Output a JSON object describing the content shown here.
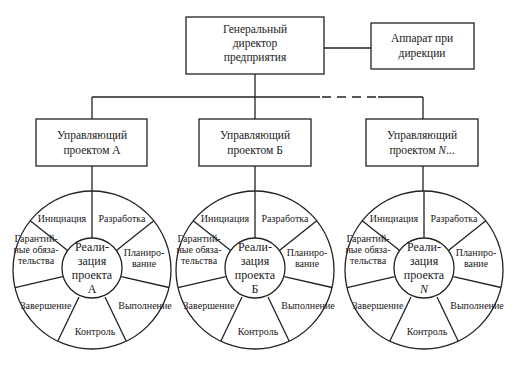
{
  "director": {
    "lines": [
      "Генеральный",
      "директор",
      "предприятия"
    ]
  },
  "apparatus": {
    "lines": [
      "Аппарат при",
      "дирекции"
    ]
  },
  "managers": [
    {
      "lines": [
        "Управляющий",
        "проектом А"
      ]
    },
    {
      "lines": [
        "Управляющий",
        "проектом Б"
      ]
    },
    {
      "lines": [
        "Управляющий",
        "проектом N..."
      ]
    }
  ],
  "wheels": [
    {
      "hub": [
        "Реали-",
        "зация",
        "проекта",
        "А"
      ],
      "segments": {
        "initiation": [
          "Инициация"
        ],
        "development": [
          "Разработка"
        ],
        "planning": [
          "Планиро-",
          "вание"
        ],
        "execution": [
          "Выполнение"
        ],
        "control": [
          "Контроль"
        ],
        "completion": [
          "Завершение"
        ],
        "warranty": [
          "Гарантий-",
          "ные обяза-",
          "тельства"
        ]
      }
    },
    {
      "hub": [
        "Реали-",
        "зация",
        "проекта",
        "Б"
      ],
      "segments": {
        "initiation": [
          "Инициация"
        ],
        "development": [
          "Разработка"
        ],
        "planning": [
          "Планиро-",
          "вание"
        ],
        "execution": [
          "Выполнение"
        ],
        "control": [
          "Контроль"
        ],
        "completion": [
          "Завершение"
        ],
        "warranty": [
          "Гарантий-",
          "ные обяза-",
          "тельства"
        ]
      }
    },
    {
      "hub": [
        "Реали-",
        "зация",
        "проекта",
        "N"
      ],
      "segments": {
        "initiation": [
          "Инициация"
        ],
        "development": [
          "Разработка"
        ],
        "planning": [
          "Планиро-",
          "вание"
        ],
        "execution": [
          "Выполнение"
        ],
        "control": [
          "Контроль"
        ],
        "completion": [
          "Завершение"
        ],
        "warranty": [
          "Гарантий-",
          "ные обяза-",
          "тельства"
        ]
      }
    }
  ]
}
